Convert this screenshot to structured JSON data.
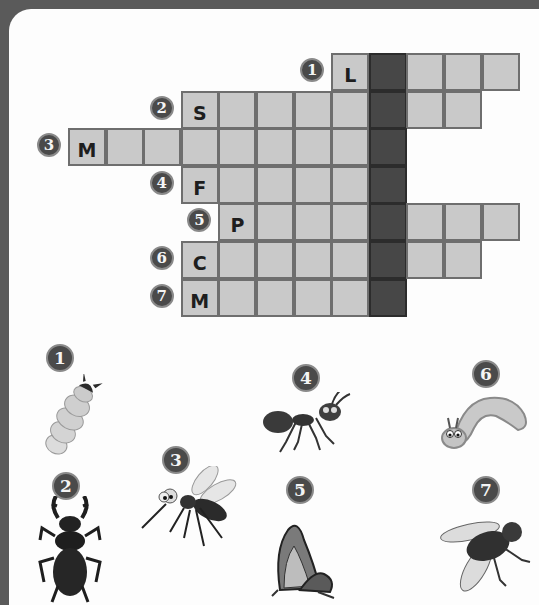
{
  "puzzle": {
    "type": "crossword",
    "theme": "insects",
    "hidden_word_column": 8,
    "colors": {
      "frame": "#5a5a5a",
      "paper": "#fdfdfd",
      "cell": "#c9c9c9",
      "cell_border": "#6e6e6e",
      "highlight_column": "#474747",
      "badge": "#4a4a4a"
    },
    "rows": [
      {
        "number": "1",
        "row": 0,
        "start_col": 7,
        "length": 5,
        "first_letter": "L"
      },
      {
        "number": "2",
        "row": 1,
        "start_col": 3,
        "length": 8,
        "first_letter": "S"
      },
      {
        "number": "3",
        "row": 2,
        "start_col": 0,
        "length": 9,
        "first_letter": "M"
      },
      {
        "number": "4",
        "row": 3,
        "start_col": 3,
        "length": 6,
        "first_letter": "F"
      },
      {
        "number": "5",
        "row": 4,
        "start_col": 4,
        "length": 8,
        "first_letter": "P"
      },
      {
        "number": "6",
        "row": 5,
        "start_col": 3,
        "length": 8,
        "first_letter": "C"
      },
      {
        "number": "7",
        "row": 6,
        "start_col": 3,
        "length": 6,
        "first_letter": "M"
      }
    ]
  },
  "clues": [
    {
      "number": "1",
      "picture": "larva-icon"
    },
    {
      "number": "2",
      "picture": "stag-beetle-icon"
    },
    {
      "number": "3",
      "picture": "mosquito-icon"
    },
    {
      "number": "4",
      "picture": "ant-icon"
    },
    {
      "number": "5",
      "picture": "butterfly-icon"
    },
    {
      "number": "6",
      "picture": "caterpillar-icon"
    },
    {
      "number": "7",
      "picture": "fly-icon"
    }
  ]
}
